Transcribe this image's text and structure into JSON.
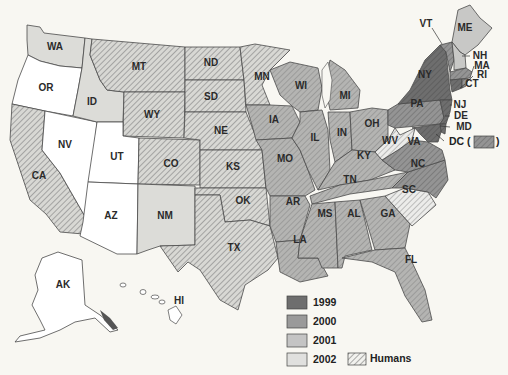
{
  "map": {
    "title": "",
    "colors": {
      "1999": "#6e6e6e",
      "2000": "#9a9a9a",
      "2001": "#c4c4c4",
      "2002": "#e0e0de",
      "none": "#ffffff",
      "humans_hatch": "#555555",
      "hatch_bg": "#d6d6d2"
    },
    "states": {
      "WA": {
        "label": "WA",
        "year": "2002",
        "humans": false
      },
      "OR": {
        "label": "OR",
        "year": null,
        "humans": false
      },
      "CA": {
        "label": "CA",
        "year": null,
        "humans": true
      },
      "NV": {
        "label": "NV",
        "year": null,
        "humans": false
      },
      "ID": {
        "label": "ID",
        "year": "2002",
        "humans": false
      },
      "MT": {
        "label": "MT",
        "year": null,
        "humans": true
      },
      "WY": {
        "label": "WY",
        "year": null,
        "humans": true
      },
      "UT": {
        "label": "UT",
        "year": null,
        "humans": false
      },
      "AZ": {
        "label": "AZ",
        "year": null,
        "humans": false
      },
      "CO": {
        "label": "CO",
        "year": null,
        "humans": true
      },
      "NM": {
        "label": "NM",
        "year": "2002",
        "humans": false
      },
      "ND": {
        "label": "ND",
        "year": null,
        "humans": true
      },
      "SD": {
        "label": "SD",
        "year": null,
        "humans": true
      },
      "NE": {
        "label": "NE",
        "year": null,
        "humans": true
      },
      "KS": {
        "label": "KS",
        "year": null,
        "humans": true
      },
      "OK": {
        "label": "OK",
        "year": null,
        "humans": true
      },
      "TX": {
        "label": "TX",
        "year": null,
        "humans": true
      },
      "MN": {
        "label": "MN",
        "year": null,
        "humans": true
      },
      "IA": {
        "label": "IA",
        "year": "2001",
        "humans": true
      },
      "MO": {
        "label": "MO",
        "year": "2001",
        "humans": true
      },
      "AR": {
        "label": "AR",
        "year": "2001",
        "humans": true
      },
      "LA": {
        "label": "LA",
        "year": "2001",
        "humans": true
      },
      "WI": {
        "label": "WI",
        "year": "2001",
        "humans": true
      },
      "IL": {
        "label": "IL",
        "year": "2001",
        "humans": true
      },
      "MI": {
        "label": "MI",
        "year": "2001",
        "humans": true
      },
      "IN": {
        "label": "IN",
        "year": "2001",
        "humans": true
      },
      "OH": {
        "label": "OH",
        "year": "2001",
        "humans": true
      },
      "KY": {
        "label": "KY",
        "year": "2001",
        "humans": true
      },
      "TN": {
        "label": "TN",
        "year": "2001",
        "humans": true
      },
      "MS": {
        "label": "MS",
        "year": "2001",
        "humans": true
      },
      "AL": {
        "label": "AL",
        "year": "2001",
        "humans": true
      },
      "GA": {
        "label": "GA",
        "year": "2001",
        "humans": true
      },
      "FL": {
        "label": "FL",
        "year": "2001",
        "humans": true
      },
      "SC": {
        "label": "SC",
        "year": "2002",
        "humans": true
      },
      "NC": {
        "label": "NC",
        "year": "2000",
        "humans": true
      },
      "VA": {
        "label": "VA",
        "year": "2000",
        "humans": true
      },
      "WV": {
        "label": "WV",
        "year": "2002",
        "humans": true
      },
      "PA": {
        "label": "PA",
        "year": "2000",
        "humans": true
      },
      "NY": {
        "label": "NY",
        "year": "1999",
        "humans": true
      },
      "VT": {
        "label": "VT",
        "year": "2000",
        "humans": true
      },
      "ME": {
        "label": "ME",
        "year": "2001",
        "humans": false
      },
      "NH": {
        "label": "NH",
        "year": "2001",
        "humans": false
      },
      "MA": {
        "label": "MA",
        "year": "2000",
        "humans": true
      },
      "RI": {
        "label": "RI",
        "year": "2000",
        "humans": true
      },
      "CT": {
        "label": "CT",
        "year": "1999",
        "humans": true
      },
      "NJ": {
        "label": "NJ",
        "year": "1999",
        "humans": true
      },
      "DE": {
        "label": "DE",
        "year": "1999",
        "humans": true
      },
      "MD": {
        "label": "MD",
        "year": "1999",
        "humans": true
      },
      "DC": {
        "label": "DC",
        "year": "2000",
        "humans": true
      },
      "AK": {
        "label": "AK",
        "year": null,
        "humans": false
      },
      "HI": {
        "label": "HI",
        "year": null,
        "humans": false
      }
    },
    "dc_callout": {
      "prefix": "DC (",
      "suffix": ")"
    }
  },
  "legend": {
    "items": [
      {
        "label": "1999",
        "color": "#6e6e6e"
      },
      {
        "label": "2000",
        "color": "#9a9a9a"
      },
      {
        "label": "2001",
        "color": "#c4c4c4"
      },
      {
        "label": "2002",
        "color": "#e0e0de"
      }
    ],
    "humans_label": "Humans"
  }
}
